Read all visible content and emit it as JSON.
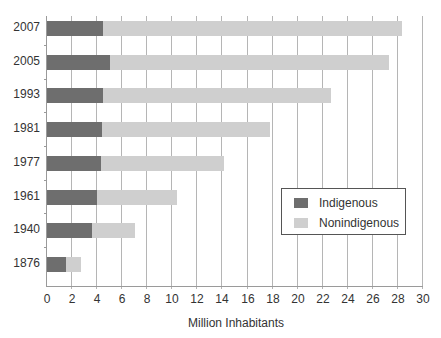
{
  "chart_data": {
    "type": "bar",
    "orientation": "horizontal",
    "stacked": true,
    "title": "",
    "xlabel": "Million Inhabitants",
    "ylabel": "",
    "xlim": [
      0,
      30
    ],
    "x_ticks": [
      "0",
      "2",
      "4",
      "6",
      "8",
      "10",
      "12",
      "14",
      "16",
      "18",
      "20",
      "22",
      "24",
      "26",
      "28",
      "30"
    ],
    "grid": "vertical",
    "legend_position": "right-center inside plot",
    "categories": [
      "2007",
      "2005",
      "1993",
      "1981",
      "1977",
      "1961",
      "1940",
      "1876"
    ],
    "series": [
      {
        "name": "Indigenous",
        "color": "#6e6e6e",
        "values": [
          4.5,
          5.0,
          4.5,
          4.4,
          4.3,
          4.0,
          3.6,
          1.5
        ]
      },
      {
        "name": "Nonindigenous",
        "color": "#cfcfcf",
        "values": [
          23.8,
          22.3,
          18.2,
          13.4,
          9.8,
          6.4,
          3.4,
          1.2
        ]
      }
    ],
    "totals": [
      28.3,
      27.3,
      22.7,
      17.8,
      14.1,
      10.4,
      7.0,
      2.7
    ]
  },
  "legend": {
    "items": [
      {
        "label": "Indigenous",
        "color": "#6e6e6e"
      },
      {
        "label": "Nonindigenous",
        "color": "#cfcfcf"
      }
    ]
  }
}
